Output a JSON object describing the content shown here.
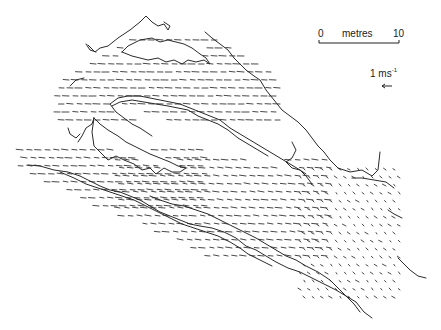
{
  "figure": {
    "type": "velocity vector map of channel flow",
    "scale_bar": {
      "start_label": "0",
      "unit_label": "metres",
      "end_label": "10",
      "length_m": 10
    },
    "velocity_key": {
      "value": "1",
      "unit": "ms",
      "exponent": "-1",
      "arrow_direction": "left"
    },
    "colors": {
      "line": "#2a2a2a",
      "background": "#ffffff"
    },
    "vector_fields": [
      {
        "name": "upper-left-channel",
        "x0": 20,
        "y0": 150,
        "x1": 200,
        "y1": 210,
        "dir_deg": 200,
        "len": 7
      },
      {
        "name": "top-channel",
        "x0": 60,
        "y0": 40,
        "x1": 280,
        "y1": 120,
        "dir_deg": 190,
        "len": 7
      },
      {
        "name": "lower-main-channel",
        "x0": 120,
        "y0": 160,
        "x1": 330,
        "y1": 260,
        "dir_deg": 205,
        "len": 7
      },
      {
        "name": "right-outlet",
        "x0": 300,
        "y0": 170,
        "x1": 400,
        "y1": 300,
        "dir_deg": 250,
        "len": 7
      }
    ]
  }
}
